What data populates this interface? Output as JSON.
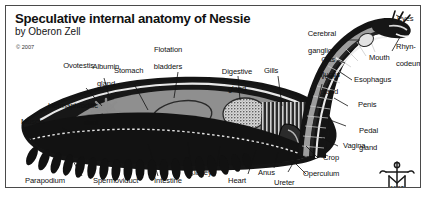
{
  "figure": {
    "title": "Speculative internal anatomy of Nessie",
    "byline": "by Oberon Zell",
    "copyright": "© 2007",
    "signature_year": "50|07",
    "signature_icon": "artist-monogram-icon",
    "border_color": "#4a4a4a",
    "background_color": "#ffffff",
    "ink_color": "#111111"
  },
  "labels": [
    {
      "id": "flotation-bladders",
      "text": "Flotation\nbladders"
    },
    {
      "id": "stomach",
      "text": "Stomach"
    },
    {
      "id": "digestive-gland",
      "text": "Digestive\ngland"
    },
    {
      "id": "gills",
      "text": "Gills"
    },
    {
      "id": "mucus-gland",
      "text": "Mucus\ngland"
    },
    {
      "id": "cerebral-ganglion",
      "text": "Cerebral\nganglion"
    },
    {
      "id": "gas-vent",
      "text": "Gas\nvent"
    },
    {
      "id": "eyes",
      "text": "Eyes"
    },
    {
      "id": "rhyncodeum",
      "text": "Rhyn-\ncodeum"
    },
    {
      "id": "mouth",
      "text": "Mouth"
    },
    {
      "id": "esophagus",
      "text": "Esophagus"
    },
    {
      "id": "penis",
      "text": "Penis"
    },
    {
      "id": "pedal-gland",
      "text": "Pedal\ngland"
    },
    {
      "id": "vagina",
      "text": "Vagina"
    },
    {
      "id": "crop",
      "text": "Crop"
    },
    {
      "id": "operculum",
      "text": "Operculum"
    },
    {
      "id": "ureter",
      "text": "Ureter"
    },
    {
      "id": "anus",
      "text": "Anus"
    },
    {
      "id": "heart",
      "text": "Heart"
    },
    {
      "id": "kidney",
      "text": "Kidney"
    },
    {
      "id": "intestine",
      "text": "Intestine"
    },
    {
      "id": "spermoviduct",
      "text": "Spermoviduct"
    },
    {
      "id": "parapodium",
      "text": "Parapodium"
    },
    {
      "id": "muscle",
      "text": "Muscle"
    },
    {
      "id": "hermaphroditic-duct",
      "text": "Hermaphroditic\nduct"
    },
    {
      "id": "ovotestis",
      "text": "Ovotestis"
    },
    {
      "id": "albumin-gland",
      "text": "Albumin\ngland"
    }
  ],
  "label_lines": {
    "flotation_bladders": "Flotation",
    "flotation_bladders2": "bladders",
    "digestive_gland": "Digestive",
    "digestive_gland2": "gland",
    "mucus_gland": "Mucus",
    "mucus_gland2": "gland",
    "cerebral_ganglion": "Cerebral",
    "cerebral_ganglion2": "ganglion",
    "gas_vent": "Gas",
    "gas_vent2": "vent",
    "rhyncodeum": "Rhyn-",
    "rhyncodeum2": "codeum",
    "pedal_gland": "Pedal",
    "pedal_gland2": "gland",
    "hermaphroditic_duct": "Hermaphroditic",
    "hermaphroditic_duct2": "duct",
    "albumin_gland": "Albumin",
    "albumin_gland2": "gland",
    "stomach": "Stomach",
    "gills": "Gills",
    "eyes": "Eyes",
    "mouth": "Mouth",
    "esophagus": "Esophagus",
    "penis": "Penis",
    "vagina": "Vagina",
    "crop": "Crop",
    "operculum": "Operculum",
    "ureter": "Ureter",
    "anus": "Anus",
    "heart": "Heart",
    "kidney": "Kidney",
    "intestine": "Intestine",
    "spermoviduct": "Spermoviduct",
    "parapodium": "Parapodium",
    "muscle": "Muscle",
    "ovotestis": "Ovotestis"
  }
}
